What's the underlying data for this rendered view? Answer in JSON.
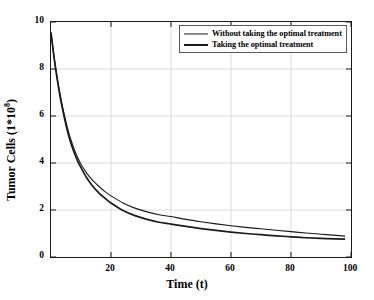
{
  "chart_data": {
    "type": "line",
    "title": "",
    "xlabel": "Time (t)",
    "ylabel": "Tumor Cells (1*10^8)",
    "ylabel_base": "Tumor Cells (1*10",
    "ylabel_exp": "8",
    "ylabel_close": ")",
    "xlim": [
      0,
      100
    ],
    "ylim": [
      0,
      10
    ],
    "xticks": [
      20,
      40,
      60,
      80,
      100
    ],
    "yticks": [
      0,
      2,
      4,
      6,
      8,
      10
    ],
    "grid": true,
    "legend_position": "top-right",
    "series": [
      {
        "name": "Without taking the optimal treatment",
        "color": "#1a1a1a",
        "linewidth": 1.1,
        "x": [
          0,
          1,
          2,
          3,
          4,
          5,
          6,
          7,
          8,
          9,
          10,
          12,
          14,
          16,
          18,
          20,
          24,
          28,
          32,
          36,
          40,
          45,
          50,
          55,
          60,
          65,
          70,
          75,
          80,
          85,
          90,
          95,
          98
        ],
        "values": [
          9.55,
          8.55,
          7.7,
          6.95,
          6.3,
          5.75,
          5.25,
          4.85,
          4.5,
          4.2,
          3.95,
          3.55,
          3.25,
          3.0,
          2.78,
          2.6,
          2.3,
          2.08,
          1.92,
          1.8,
          1.72,
          1.6,
          1.5,
          1.41,
          1.33,
          1.26,
          1.2,
          1.14,
          1.08,
          1.02,
          0.97,
          0.92,
          0.89
        ]
      },
      {
        "name": "Taking the optimal treatment",
        "color": "#1a1a1a",
        "linewidth": 1.6,
        "x": [
          0,
          1,
          2,
          3,
          4,
          5,
          6,
          7,
          8,
          9,
          10,
          12,
          14,
          16,
          18,
          20,
          24,
          28,
          32,
          36,
          40,
          45,
          50,
          55,
          60,
          65,
          70,
          75,
          80,
          85,
          90,
          95,
          98
        ],
        "values": [
          9.55,
          8.5,
          7.62,
          6.85,
          6.2,
          5.62,
          5.12,
          4.7,
          4.35,
          4.05,
          3.8,
          3.35,
          3.0,
          2.72,
          2.5,
          2.3,
          1.98,
          1.76,
          1.6,
          1.48,
          1.4,
          1.3,
          1.21,
          1.13,
          1.06,
          1.0,
          0.95,
          0.9,
          0.86,
          0.82,
          0.79,
          0.77,
          0.76
        ]
      }
    ],
    "legend": [
      {
        "label": "Without taking the optimal treatment",
        "style": "thin"
      },
      {
        "label": "Taking the optimal treatment",
        "style": "thick"
      }
    ],
    "colors": {
      "line": "#1a1a1a",
      "axis": "#1a1a1a",
      "grid": "#d2d2d2",
      "background": "#ffffff",
      "legend_border": "#5a5a5a"
    }
  }
}
